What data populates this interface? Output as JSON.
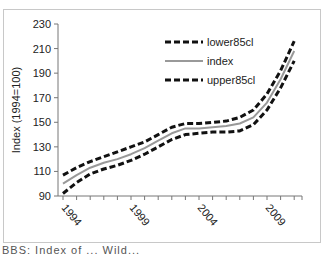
{
  "chart_data": {
    "type": "line",
    "title": "",
    "xlabel": "",
    "ylabel": "Index (1994=100)",
    "ylim": [
      90,
      230
    ],
    "yticks": [
      90,
      110,
      130,
      150,
      170,
      190,
      210,
      230
    ],
    "xtick_labels": [
      "1994",
      "1999",
      "2004",
      "2009"
    ],
    "x": [
      1994,
      1995,
      1996,
      1997,
      1998,
      1999,
      2000,
      2001,
      2002,
      2003,
      2004,
      2005,
      2006,
      2007,
      2008,
      2009,
      2010,
      2011
    ],
    "series": [
      {
        "name": "lower85cl",
        "style": "dashed",
        "color": "#111111",
        "values": [
          92,
          101,
          108,
          112,
          115,
          119,
          124,
          130,
          136,
          140,
          141,
          142,
          142,
          143,
          148,
          160,
          178,
          200
        ]
      },
      {
        "name": "index",
        "style": "solid",
        "color": "#999999",
        "values": [
          100,
          107,
          113,
          117,
          120,
          124,
          129,
          135,
          141,
          145,
          145,
          146,
          147,
          149,
          154,
          166,
          185,
          208
        ]
      },
      {
        "name": "upper85cl",
        "style": "dashed",
        "color": "#111111",
        "values": [
          107,
          113,
          118,
          122,
          126,
          130,
          134,
          140,
          146,
          149,
          149,
          150,
          151,
          154,
          160,
          173,
          192,
          216
        ]
      }
    ],
    "legend": {
      "position": "upper-center",
      "entries": [
        "lower85cl",
        "index",
        "upper85cl"
      ]
    },
    "grid": false
  },
  "caption": "BBS: Index of ... Wild..."
}
